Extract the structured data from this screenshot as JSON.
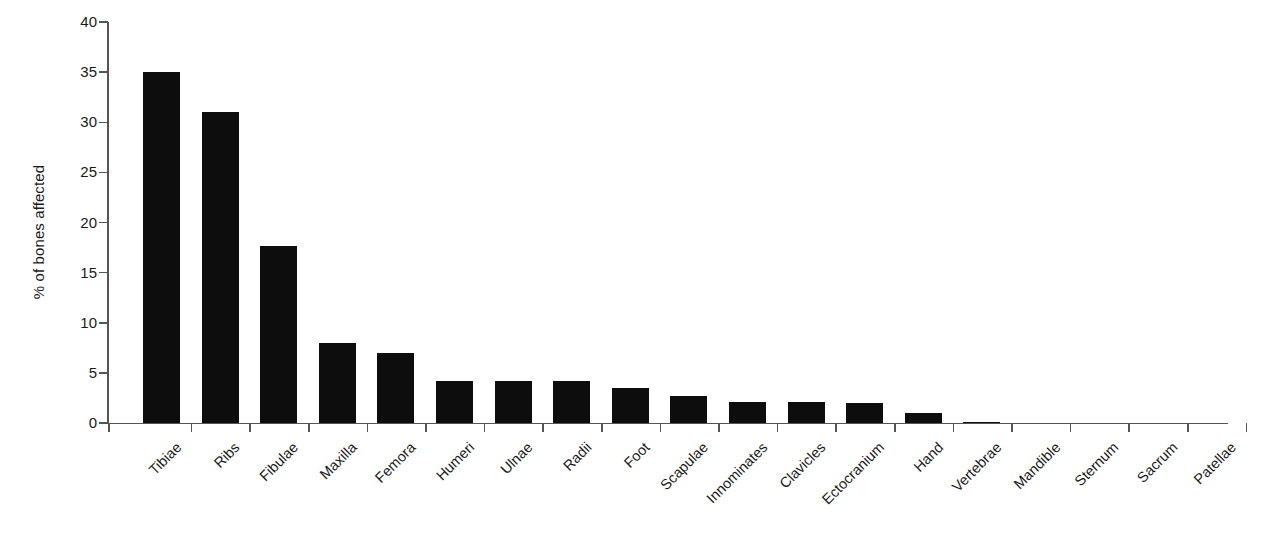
{
  "chart_data": {
    "type": "bar",
    "title": "",
    "subtitle": "",
    "xlabel": "",
    "ylabel": "% of bones affected",
    "ylim": [
      0,
      40
    ],
    "ytick_values": [
      0,
      5,
      10,
      15,
      20,
      25,
      30,
      35,
      40
    ],
    "ytick_labels": [
      "0",
      "5",
      "10",
      "15",
      "20",
      "25",
      "30",
      "35",
      "40"
    ],
    "grid": false,
    "legend": null,
    "bar_color": "#0d0d0d",
    "axis_color": "#555555",
    "categories": [
      "Tibiae",
      "Ribs",
      "Fibulae",
      "Maxilla",
      "Femora",
      "Humeri",
      "Ulnae",
      "Radii",
      "Foot",
      "Scapulae",
      "Innominates",
      "Clavicles",
      "Ectocranium",
      "Hand",
      "Vertebrae",
      "Mandible",
      "Sternum",
      "Sacrum",
      "Patellae"
    ],
    "values": [
      35.0,
      31.0,
      17.7,
      8.0,
      7.0,
      4.2,
      4.2,
      4.2,
      3.5,
      2.7,
      2.1,
      2.1,
      2.0,
      1.0,
      0.15,
      0.0,
      0.0,
      0.0,
      0.0
    ]
  }
}
